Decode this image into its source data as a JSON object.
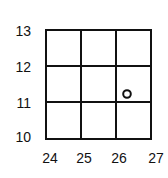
{
  "grid": {
    "x_labels": [
      "24",
      "25",
      "26",
      "27"
    ],
    "y_labels": [
      "13",
      "12",
      "11",
      "10"
    ],
    "x_range": [
      24,
      27
    ],
    "y_range": [
      10,
      13
    ]
  },
  "marker": {
    "shape": "circle",
    "x": 26.3,
    "y": 11.2
  }
}
